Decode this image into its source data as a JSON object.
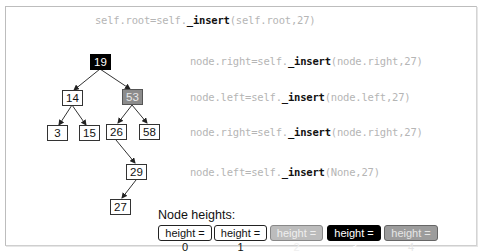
{
  "code_lines": [
    {
      "prefix": "self.root=self.",
      "method": "_insert",
      "args": "(self.root,27)"
    },
    {
      "prefix": "node.right=self.",
      "method": "_insert",
      "args": "(node.right,27)"
    },
    {
      "prefix": "node.left=self.",
      "method": "_insert",
      "args": "(node.left,27)"
    },
    {
      "prefix": "node.right=self.",
      "method": "_insert",
      "args": "(node.right,27)"
    },
    {
      "prefix": "node.left=self.",
      "method": "_insert",
      "args": "(None,27)"
    }
  ],
  "tree": {
    "nodes": [
      {
        "key": "19",
        "height": 3
      },
      {
        "key": "14",
        "height": 1
      },
      {
        "key": "53",
        "height": 4
      },
      {
        "key": "3",
        "height": 0
      },
      {
        "key": "15",
        "height": 0
      },
      {
        "key": "26",
        "height": 1
      },
      {
        "key": "58",
        "height": 0
      },
      {
        "key": "29",
        "height": 1
      },
      {
        "key": "27",
        "height": 0
      }
    ],
    "edges": [
      [
        "19",
        "14"
      ],
      [
        "19",
        "53"
      ],
      [
        "14",
        "3"
      ],
      [
        "14",
        "15"
      ],
      [
        "53",
        "26"
      ],
      [
        "53",
        "58"
      ],
      [
        "26",
        "29"
      ],
      [
        "29",
        "27"
      ]
    ]
  },
  "legend": {
    "title": "Node heights:",
    "items": [
      {
        "label": "height = 0",
        "color": "#ffffff"
      },
      {
        "label": "height = 1",
        "color": "#ffffff"
      },
      {
        "label": "height = 2",
        "color": "#bcbcbc"
      },
      {
        "label": "height = 3",
        "color": "#000000"
      },
      {
        "label": "height = 4",
        "color": "#9c9c9c"
      }
    ]
  }
}
